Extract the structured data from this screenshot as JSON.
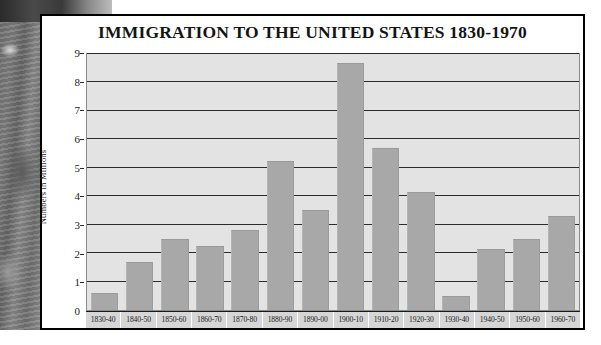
{
  "chart_data": {
    "type": "bar",
    "title": "IMMIGRATION TO THE UNITED STATES 1830-1970",
    "xlabel": "",
    "ylabel": "Numbers in Millions",
    "ylim": [
      0,
      9
    ],
    "yticks": [
      0,
      1,
      2,
      3,
      4,
      5,
      6,
      7,
      8,
      9
    ],
    "grid": true,
    "legend": "none",
    "bar_color": "#a8a8a8",
    "plot_background": "#e3e3e3",
    "categories": [
      "1830-40",
      "1840-50",
      "1850-60",
      "1860-70",
      "1870-80",
      "1880-90",
      "1890-00",
      "1900-10",
      "1910-20",
      "1920-30",
      "1930-40",
      "1940-50",
      "1950-60",
      "1960-70"
    ],
    "values": [
      0.6,
      1.7,
      2.5,
      2.25,
      2.8,
      5.25,
      3.5,
      8.7,
      5.7,
      4.15,
      0.5,
      2.15,
      2.5,
      3.3
    ]
  }
}
